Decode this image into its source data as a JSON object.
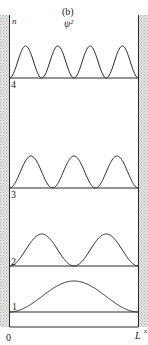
{
  "figure": {
    "panel_label": "(b)",
    "quantity_label": "ψ²",
    "axis_n_label": "n",
    "x_origin_label": "0",
    "x_end_label": "L",
    "x_axis_label": "x",
    "line_color": "#2a2a2a",
    "wall_hatch_color": "#bdbdbd"
  },
  "levels": [
    {
      "n": 1,
      "label": "1",
      "humps": 1
    },
    {
      "n": 2,
      "label": "2",
      "humps": 2
    },
    {
      "n": 3,
      "label": "3",
      "humps": 3
    },
    {
      "n": 4,
      "label": "4",
      "humps": 4
    }
  ]
}
